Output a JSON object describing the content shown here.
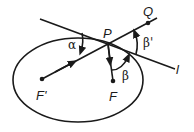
{
  "diagram": {
    "labels": {
      "P": "P",
      "Q": "Q",
      "F_prime": "F'",
      "F": "F",
      "l": "l",
      "alpha": "α",
      "beta": "β",
      "beta_prime": "β'"
    },
    "elements": [
      {
        "id": "ellipse",
        "description": "ellipse with foci F' and F"
      },
      {
        "id": "tangent-line",
        "label": "l",
        "description": "tangent line at point P"
      },
      {
        "id": "ray-fprime-q",
        "description": "ray from F' through P to Q"
      },
      {
        "id": "ray-p-f",
        "description": "ray from P to focus F"
      }
    ],
    "angles": [
      {
        "label": "α",
        "between": "tangent l and ray F'P"
      },
      {
        "label": "β'",
        "between": "ray PQ and tangent l"
      },
      {
        "label": "β",
        "between": "ray PF and tangent l"
      }
    ]
  }
}
